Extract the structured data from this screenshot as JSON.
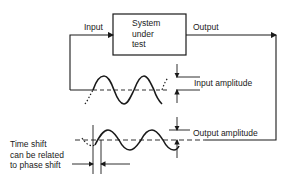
{
  "diagram": {
    "system_box": {
      "lines": [
        "System",
        "under",
        "test"
      ]
    },
    "labels": {
      "input": "Input",
      "output": "Output",
      "input_amplitude": "Input amplitude",
      "output_amplitude": "Output amplitude",
      "time_shift": [
        "Time shift",
        "can be related",
        "to phase shift"
      ]
    },
    "colors": {
      "ink": "#1a1a1a",
      "background": "#ffffff"
    }
  }
}
